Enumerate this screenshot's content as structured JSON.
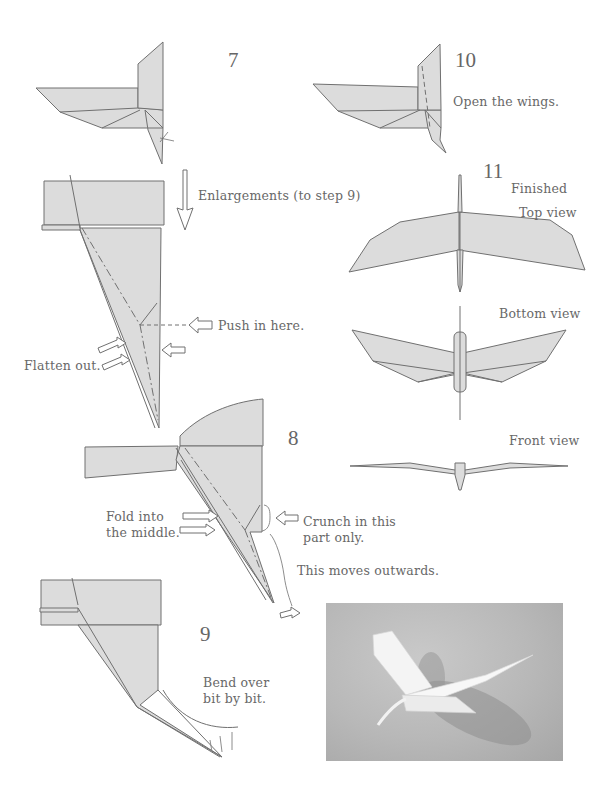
{
  "steps": {
    "step7": {
      "number": "7"
    },
    "enlargement": {
      "label": "Enlargements (to step 9)",
      "push_label": "Push in here.",
      "flatten_label": "Flatten out."
    },
    "step8": {
      "number": "8",
      "fold_label_line1": "Fold into",
      "fold_label_line2": "the middle.",
      "crunch_line1": "Crunch in this",
      "crunch_line2": "part only.",
      "moves_label": "This moves outwards."
    },
    "step9": {
      "number": "9",
      "bend_line1": "Bend over",
      "bend_line2": "bit by bit."
    },
    "step10": {
      "number": "10",
      "instruction": "Open the wings."
    },
    "step11": {
      "number": "11",
      "finished": "Finished",
      "top_view": "Top view",
      "bottom_view": "Bottom view",
      "front_view": "Front view"
    }
  },
  "photo": {
    "subject": "folded paper bird model"
  },
  "colors": {
    "paper_fill": "#dcdcdc",
    "line": "#6f6f6f",
    "text": "#686868",
    "background": "#ffffff"
  }
}
